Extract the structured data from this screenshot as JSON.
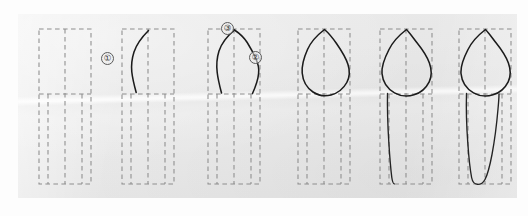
{
  "figure": {
    "title": "",
    "kind": "step-by-step line drawing sequence",
    "panel_count": 6,
    "background_color": "#e8e8e8",
    "ink_color": "#1b1b1b",
    "guide_color": "#8d8d8d",
    "guide_style": "dashed rectangular construction grid"
  },
  "markers": [
    {
      "id": "marker-1",
      "label": "①",
      "number": "1",
      "panel": 2,
      "x": 102,
      "y": 53
    },
    {
      "id": "marker-2",
      "label": "②",
      "number": "2",
      "panel": 3,
      "x": 250,
      "y": 52
    },
    {
      "id": "marker-3",
      "label": "③",
      "number": "3",
      "panel": 3,
      "x": 222,
      "y": 23
    }
  ],
  "panels": [
    {
      "id": "panel-1",
      "index": "1",
      "caption": "",
      "content": "empty construction grid"
    },
    {
      "id": "panel-2",
      "index": "2",
      "caption": "",
      "content": "first stroke: mesial crown outline"
    },
    {
      "id": "panel-3",
      "index": "3",
      "caption": "",
      "content": "cusp tip and distal crown outline added"
    },
    {
      "id": "panel-4",
      "index": "4",
      "caption": "",
      "content": "crown outline closed at cervical line"
    },
    {
      "id": "panel-5",
      "index": "5",
      "caption": "",
      "content": "mesial root outline drawn"
    },
    {
      "id": "panel-6",
      "index": "6",
      "caption": "",
      "content": "root completed, full tooth outline"
    }
  ]
}
